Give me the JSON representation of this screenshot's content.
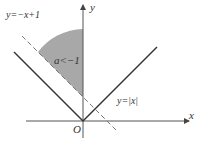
{
  "diagram": {
    "title": "",
    "axes": {
      "x_label": "x",
      "y_label": "y",
      "origin_label": "O"
    },
    "curves": [
      {
        "id": "abs",
        "label": "y=|x|",
        "style": "solid",
        "color": "#333333"
      },
      {
        "id": "line",
        "label": "y=−x+1",
        "style": "dashed",
        "color": "#777777"
      }
    ],
    "region": {
      "label": "a<−1",
      "fill": "#a8a8a8"
    }
  }
}
